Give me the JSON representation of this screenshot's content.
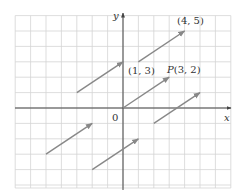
{
  "diagram": {
    "type": "vector-diagram",
    "axes": {
      "x_label": "x",
      "y_label": "y",
      "origin_label": "0",
      "x_range": [
        -7,
        7
      ],
      "y_range": [
        -5,
        6
      ]
    },
    "grid": {
      "spacing_units": 1,
      "visible": true
    },
    "colors": {
      "grid": "#d0d0d0",
      "axis": "#444444",
      "vector": "#888888",
      "text": "#333333"
    },
    "vectors": [
      {
        "from": [
          0,
          0
        ],
        "to": [
          3,
          2
        ],
        "label": "P(3, 2)"
      },
      {
        "from": [
          1,
          3
        ],
        "to": [
          4,
          5
        ],
        "label": "(4, 5)"
      },
      {
        "from": [
          -3,
          1
        ],
        "to": [
          0,
          3
        ],
        "label": ""
      },
      {
        "from": [
          -5,
          -3
        ],
        "to": [
          -2,
          -1
        ],
        "label": ""
      },
      {
        "from": [
          -2,
          -4
        ],
        "to": [
          1,
          -2
        ],
        "label": ""
      },
      {
        "from": [
          2,
          -1
        ],
        "to": [
          5,
          1
        ],
        "label": ""
      }
    ],
    "labels": {
      "point_4_5": "(4, 5)",
      "point_1_3": "(1, 3)",
      "point_P_prefix": "P",
      "point_P_coords": "(3, 2)"
    }
  }
}
